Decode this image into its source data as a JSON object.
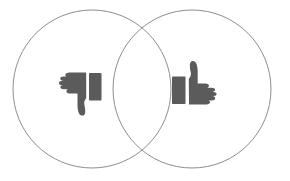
{
  "figure": {
    "title": "Thumbs down / thumbs up Venn diagram",
    "type": "venn-diagram",
    "background_color": "#ffffff",
    "width": 290,
    "height": 181
  },
  "style": {
    "circle_stroke_color": "#8e8e8e",
    "circle_stroke_width": 1,
    "circle_fill": "none",
    "icon_fill_color": "#5b5b5b"
  },
  "circles": [
    {
      "name": "left-circle",
      "label": "",
      "cx": 92,
      "cy": 89,
      "r": 79
    },
    {
      "name": "right-circle",
      "label": "",
      "cx": 192,
      "cy": 89,
      "r": 79
    }
  ],
  "icons": [
    {
      "name": "thumbs-down-icon",
      "semantic": "thumbs-down",
      "label": "",
      "cx": 77,
      "cy": 89,
      "fill": "#5b5b5b"
    },
    {
      "name": "thumbs-up-icon",
      "semantic": "thumbs-up",
      "label": "",
      "cx": 205,
      "cy": 89,
      "fill": "#5b5b5b"
    }
  ],
  "labels": {
    "left_label": "",
    "right_label": "",
    "overlap_label": "",
    "caption": ""
  }
}
